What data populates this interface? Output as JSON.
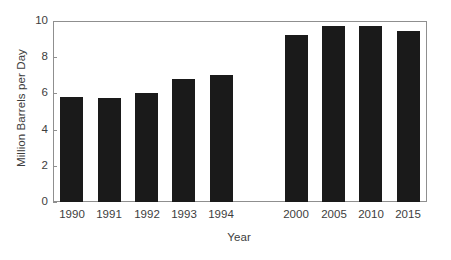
{
  "chart_data": {
    "type": "bar",
    "title": "",
    "xlabel": "Year",
    "ylabel": "Million Barrels per Day",
    "categories": [
      "1990",
      "1991",
      "1992",
      "1993",
      "1994",
      "2000",
      "2005",
      "2010",
      "2015"
    ],
    "values": [
      5.8,
      5.75,
      6.0,
      6.8,
      7.0,
      9.2,
      9.7,
      9.7,
      9.45
    ],
    "ylim": [
      0,
      10
    ],
    "y_ticks": [
      "0",
      "2",
      "4",
      "6",
      "8",
      "10"
    ],
    "y_tick_values": [
      0,
      2,
      4,
      6,
      8,
      10
    ],
    "grid": false,
    "legend": "none",
    "bar_color": "#1a1a1a",
    "frame_color": "#8f8f8f",
    "background": "#ffffff",
    "category_gap_after": "1994"
  }
}
